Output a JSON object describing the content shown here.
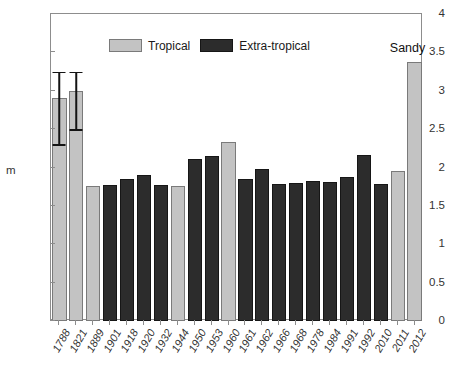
{
  "chart_data": {
    "type": "bar",
    "title": "",
    "xlabel": "",
    "ylabel": "m",
    "ylim": [
      0,
      4
    ],
    "yticks": [
      "0",
      "0.5",
      "1",
      "1.5",
      "2",
      "2.5",
      "3",
      "3.5",
      "4"
    ],
    "ytick_values": [
      0,
      0.5,
      1,
      1.5,
      2,
      2.5,
      3,
      3.5,
      4
    ],
    "grid": false,
    "legend_position": "top-left-inside",
    "legend": [
      {
        "label": "Tropical",
        "color": "#c3c3c3",
        "key": "tropical"
      },
      {
        "label": "Extra-tropical",
        "color": "#2c2c2c",
        "key": "extratropical"
      }
    ],
    "categories": [
      "1788",
      "1821",
      "1889",
      "1901",
      "1918",
      "1920",
      "1932",
      "1944",
      "1950",
      "1953",
      "1960",
      "1961",
      "1962",
      "1966",
      "1968",
      "1978",
      "1984",
      "1991",
      "1992",
      "2010",
      "2011",
      "2012"
    ],
    "values": [
      2.9,
      3.0,
      1.76,
      1.77,
      1.85,
      1.9,
      1.77,
      1.76,
      2.11,
      2.15,
      2.33,
      1.85,
      1.98,
      1.78,
      1.8,
      1.82,
      1.81,
      1.87,
      2.16,
      1.79,
      1.96,
      3.38
    ],
    "series_type": [
      "tropical",
      "tropical",
      "tropical",
      "extratropical",
      "extratropical",
      "extratropical",
      "extratropical",
      "tropical",
      "extratropical",
      "extratropical",
      "tropical",
      "extratropical",
      "extratropical",
      "extratropical",
      "extratropical",
      "extratropical",
      "extratropical",
      "extratropical",
      "extratropical",
      "extratropical",
      "tropical",
      "tropical"
    ],
    "error_bars": [
      {
        "category": "1788",
        "value": 2.9,
        "low": 2.3,
        "high": 3.25
      },
      {
        "category": "1821",
        "value": 3.0,
        "low": 2.5,
        "high": 3.25
      }
    ],
    "annotations": [
      {
        "text": "Sandy",
        "category": "2012",
        "value": 3.38
      }
    ]
  },
  "colors": {
    "tropical": "#c3c3c3",
    "extratropical": "#2c2c2c",
    "axis": "#8d8d8d",
    "text": "#333333",
    "background": "#ffffff"
  }
}
